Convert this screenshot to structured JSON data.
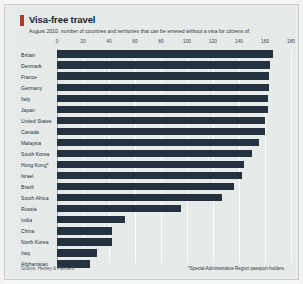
{
  "chart_data": {
    "type": "bar",
    "orientation": "horizontal",
    "title": "Visa-free travel",
    "subtitle": "August 2010, number of countries and territories that can be entered without a visa for citizens of:",
    "xlabel": "",
    "ylabel": "",
    "xlim": [
      0,
      180
    ],
    "xticks": [
      0,
      20,
      40,
      60,
      80,
      100,
      120,
      140,
      160,
      180
    ],
    "grid": true,
    "legend": "none",
    "bar_color": "#243240",
    "accent_color": "#b4342c",
    "background_color": "#e6eae8",
    "categories": [
      "Britain",
      "Denmark",
      "France",
      "Germany",
      "Italy",
      "Japan",
      "United States",
      "Canada",
      "Malaysia",
      "South Korea",
      "Hong Kong*",
      "Israel",
      "Brazil",
      "South Africa",
      "Russia",
      "India",
      "China",
      "North Korea",
      "Iraq",
      "Afghanistan"
    ],
    "values": [
      166,
      164,
      163,
      163,
      162,
      162,
      160,
      160,
      155,
      150,
      144,
      142,
      136,
      127,
      95,
      52,
      42,
      42,
      31,
      25
    ],
    "source": "Source: Henley & Partners",
    "footnote": "*Special Administrative Region passport-holders"
  }
}
